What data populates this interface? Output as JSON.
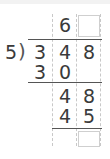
{
  "problem": {
    "divisor": "5",
    "dividend": [
      "3",
      "4",
      "8"
    ],
    "quotient": [
      "6",
      ""
    ],
    "steps": [
      {
        "row": [
          "3",
          "0",
          ""
        ]
      },
      {
        "row": [
          "",
          "4",
          "8"
        ]
      },
      {
        "row": [
          "",
          "4",
          "5"
        ]
      },
      {
        "row": [
          "",
          "",
          ""
        ]
      }
    ]
  }
}
